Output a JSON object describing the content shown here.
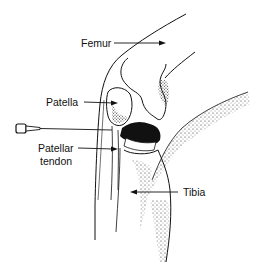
{
  "figure": {
    "labels": {
      "femur": "Femur",
      "patella": "Patella",
      "patellar_tendon_line1": "Patellar",
      "patellar_tendon_line2": "tendon",
      "tibia": "Tibia"
    },
    "colors": {
      "ink": "#111111",
      "background": "#ffffff"
    }
  }
}
